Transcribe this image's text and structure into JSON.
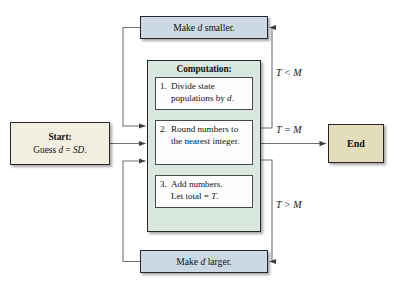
{
  "diagram": {
    "background": "#ffffff"
  },
  "start": {
    "title": "Start:",
    "text": "Guess d = SD."
  },
  "end": {
    "label": "End"
  },
  "loops": {
    "smaller": "Make d smaller.",
    "larger": "Make d larger."
  },
  "computation": {
    "title": "Computation:",
    "steps": [
      {
        "number": "1.",
        "text": "Divide state populations by d."
      },
      {
        "number": "2.",
        "text": "Round numbers to the nearest integer."
      },
      {
        "number": "3.",
        "text": "Add numbers. Let total = T."
      }
    ]
  },
  "conditions": {
    "less_than": "T < M",
    "equal": "T = M",
    "greater_than": "T > M"
  },
  "colors": {
    "start_fill": "#f2efe0",
    "end_fill": "#e3ddb9",
    "loop_fill": "#ccd8e4",
    "computation_fill": "#d8e8df",
    "step_fill": "#fefefe",
    "border": "#26262b",
    "wire": "#6e6e74"
  }
}
